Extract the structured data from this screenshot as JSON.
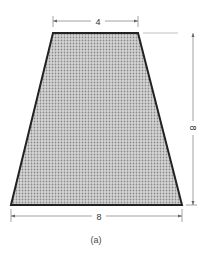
{
  "figure": {
    "caption": "(a)",
    "shape": "trapezoid",
    "fill_color": "#b8b8b8",
    "stroke_color": "#222222",
    "dimensions": {
      "top_width": "4",
      "bottom_width": "8",
      "height": "8"
    }
  }
}
